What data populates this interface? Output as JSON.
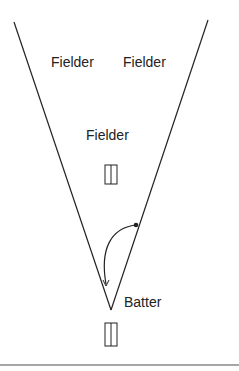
{
  "diagram": {
    "labels": {
      "fielder_left": "Fielder",
      "fielder_right": "Fielder",
      "fielder_center": "Fielder",
      "batter": "Batter"
    },
    "colors": {
      "line": "#222222",
      "baseline": "#888888",
      "background": "#ffffff"
    }
  }
}
